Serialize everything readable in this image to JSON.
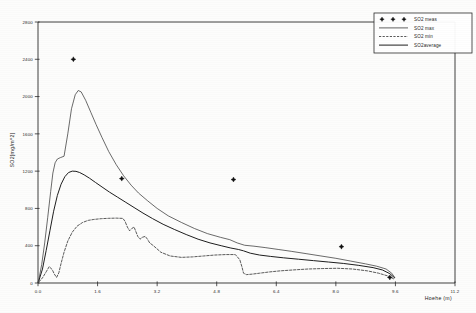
{
  "chart_data": {
    "type": "line",
    "title": "",
    "xlabel": "Hoehe (m)",
    "ylabel": "SO2[mg/m^2]",
    "xlim": [
      0.0,
      11.2
    ],
    "ylim": [
      0,
      2800
    ],
    "xticks": [
      "0.0",
      "1.6",
      "3.2",
      "4.8",
      "6.4",
      "8.0",
      "9.6",
      "11.2"
    ],
    "xtick_values": [
      0.0,
      1.6,
      3.2,
      4.8,
      6.4,
      8.0,
      9.6,
      11.2
    ],
    "yticks": [
      "0",
      "400",
      "800",
      "1200",
      "1600",
      "2000",
      "2400",
      "2800"
    ],
    "ytick_values": [
      0,
      400,
      800,
      1200,
      1600,
      2000,
      2400,
      2800
    ],
    "grid": false,
    "legend_position": "top-right",
    "series": [
      {
        "name": "SO2 meas",
        "style": "scatter",
        "marker": "star",
        "x": [
          0.95,
          2.25,
          5.25,
          8.15,
          9.45
        ],
        "values": [
          2400,
          1120,
          1110,
          390,
          60
        ]
      },
      {
        "name": "SO2 max",
        "style": "line",
        "x": [
          0.02,
          0.1,
          0.18,
          0.26,
          0.34,
          0.4,
          0.46,
          0.52,
          0.6,
          0.7,
          0.8,
          0.9,
          1.0,
          1.08,
          1.16,
          1.28,
          1.42,
          1.56,
          1.72,
          1.9,
          2.1,
          2.3,
          2.5,
          2.7,
          2.95,
          3.2,
          3.5,
          3.85,
          4.2,
          4.55,
          4.9,
          5.15,
          5.35,
          5.55,
          5.8,
          6.1,
          6.45,
          6.8,
          7.2,
          7.6,
          8.0,
          8.4,
          8.8,
          9.1,
          9.35,
          9.5,
          9.58
        ],
        "values": [
          30,
          200,
          430,
          700,
          980,
          1180,
          1290,
          1330,
          1345,
          1360,
          1600,
          1870,
          2020,
          2065,
          2050,
          1960,
          1830,
          1700,
          1560,
          1410,
          1270,
          1150,
          1050,
          965,
          880,
          800,
          720,
          650,
          585,
          530,
          490,
          465,
          430,
          405,
          395,
          380,
          360,
          340,
          315,
          290,
          265,
          235,
          205,
          180,
          150,
          105,
          60
        ]
      },
      {
        "name": "SO2 min",
        "style": "dashed",
        "x": [
          0.02,
          0.12,
          0.22,
          0.3,
          0.38,
          0.44,
          0.5,
          0.56,
          0.62,
          0.7,
          0.8,
          0.92,
          1.05,
          1.2,
          1.35,
          1.5,
          1.7,
          1.9,
          2.1,
          2.28,
          2.34,
          2.4,
          2.46,
          2.52,
          2.58,
          2.62,
          2.68,
          2.74,
          2.8,
          2.88,
          2.94,
          3.0,
          3.1,
          3.3,
          3.55,
          3.85,
          4.15,
          4.45,
          4.75,
          5.05,
          5.3,
          5.42,
          5.48,
          5.52,
          5.6,
          5.75,
          5.95,
          6.2,
          6.5,
          6.85,
          7.25,
          7.65,
          8.05,
          8.45,
          8.85,
          9.15,
          9.4,
          9.55
        ],
        "values": [
          10,
          55,
          120,
          175,
          145,
          95,
          60,
          110,
          210,
          330,
          450,
          545,
          610,
          650,
          672,
          682,
          690,
          694,
          696,
          693,
          660,
          600,
          560,
          585,
          600,
          560,
          500,
          470,
          490,
          500,
          470,
          430,
          400,
          330,
          290,
          275,
          280,
          290,
          300,
          305,
          305,
          250,
          170,
          105,
          90,
          95,
          105,
          118,
          130,
          140,
          150,
          155,
          158,
          150,
          130,
          105,
          75,
          45
        ]
      },
      {
        "name": "SO2average",
        "style": "line",
        "x": [
          0.02,
          0.12,
          0.22,
          0.32,
          0.42,
          0.52,
          0.62,
          0.72,
          0.82,
          0.92,
          1.02,
          1.12,
          1.24,
          1.38,
          1.54,
          1.72,
          1.92,
          2.14,
          2.36,
          2.58,
          2.82,
          3.08,
          3.36,
          3.66,
          3.98,
          4.3,
          4.62,
          4.92,
          5.18,
          5.38,
          5.52,
          5.7,
          5.95,
          6.25,
          6.6,
          7.0,
          7.4,
          7.8,
          8.2,
          8.6,
          9.0,
          9.25,
          9.45,
          9.58
        ],
        "values": [
          20,
          150,
          350,
          560,
          770,
          940,
          1060,
          1140,
          1185,
          1200,
          1198,
          1185,
          1160,
          1125,
          1080,
          1030,
          975,
          920,
          865,
          810,
          750,
          690,
          630,
          575,
          520,
          470,
          430,
          400,
          375,
          360,
          345,
          320,
          300,
          285,
          270,
          255,
          240,
          225,
          210,
          190,
          165,
          140,
          100,
          55
        ]
      }
    ]
  },
  "legend": {
    "items": [
      {
        "label": "SO2  meas",
        "marker": "star"
      },
      {
        "label": "SO2  max",
        "marker": "line-thin"
      },
      {
        "label": "SO2  min",
        "marker": "line-dashed"
      },
      {
        "label": "SO2average",
        "marker": "line-thick"
      }
    ]
  },
  "axes": {
    "y_title": "SO2[mg/m^2]",
    "x_title": "Hoehe  (m)"
  }
}
